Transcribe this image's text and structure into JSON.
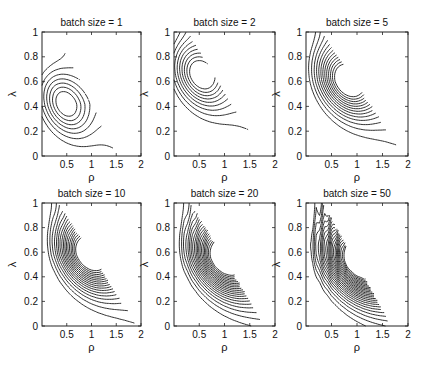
{
  "chart_data": [
    {
      "type": "contour",
      "title": "batch size = 1",
      "xlabel": "ρ",
      "ylabel": "λ",
      "xlim": [
        0,
        2
      ],
      "ylim": [
        0,
        1
      ],
      "xticks": [
        "0.5",
        "1",
        "1.5",
        "2"
      ],
      "yticks": [
        "0",
        "0.2",
        "0.4",
        "0.6",
        "0.8",
        "1"
      ],
      "batch_size": 1,
      "contour_levels": 7,
      "optimum": {
        "rho": 0.45,
        "lambda": 0.42
      },
      "zero_boundary_rho_at_lambda0": 1.55
    },
    {
      "type": "contour",
      "title": "batch size = 2",
      "xlabel": "ρ",
      "ylabel": "λ",
      "xlim": [
        0,
        2
      ],
      "ylim": [
        0,
        1
      ],
      "xticks": [
        "0.5",
        "1",
        "1.5",
        "2"
      ],
      "yticks": [
        "0",
        "0.2",
        "0.4",
        "0.6",
        "0.8",
        "1"
      ],
      "batch_size": 2,
      "contour_levels": 9,
      "optimum": {
        "rho": 0.5,
        "lambda": 0.65
      },
      "zero_boundary_rho_at_lambda0": 1.8
    },
    {
      "type": "contour",
      "title": "batch size = 5",
      "xlabel": "ρ",
      "ylabel": "λ",
      "xlim": [
        0,
        2
      ],
      "ylim": [
        0,
        1
      ],
      "xticks": [
        "0.5",
        "1",
        "1.5",
        "2"
      ],
      "yticks": [
        "0",
        "0.2",
        "0.4",
        "0.6",
        "0.8",
        "1"
      ],
      "batch_size": 5,
      "contour_levels": 13,
      "optimum": {
        "rho": 0.8,
        "lambda": 0.6
      },
      "zero_boundary_rho_at_lambda0": 1.95
    },
    {
      "type": "contour",
      "title": "batch size = 10",
      "xlabel": "ρ",
      "ylabel": "λ",
      "xlim": [
        0,
        2
      ],
      "ylim": [
        0,
        1
      ],
      "xticks": [
        "0.5",
        "1",
        "1.5",
        "2"
      ],
      "yticks": [
        "0",
        "0.2",
        "0.4",
        "0.6",
        "0.8",
        "1"
      ],
      "batch_size": 10,
      "contour_levels": 17,
      "optimum": {
        "rho": 0.95,
        "lambda": 0.58
      },
      "zero_boundary_rho_at_lambda0": 1.95
    },
    {
      "type": "contour",
      "title": "batch size = 20",
      "xlabel": "ρ",
      "ylabel": "λ",
      "xlim": [
        0,
        2
      ],
      "ylim": [
        0,
        1
      ],
      "xticks": [
        "0.5",
        "1",
        "1.5",
        "2"
      ],
      "yticks": [
        "0",
        "0.2",
        "0.4",
        "0.6",
        "0.8",
        "1"
      ],
      "batch_size": 20,
      "contour_levels": 20,
      "optimum": {
        "rho": 1.0,
        "lambda": 0.55
      },
      "zero_boundary_rho_at_lambda0": 1.82
    },
    {
      "type": "contour",
      "title": "batch size = 50",
      "xlabel": "ρ",
      "ylabel": "λ",
      "xlim": [
        0,
        2
      ],
      "ylim": [
        0,
        1
      ],
      "xticks": [
        "0.5",
        "1",
        "1.5",
        "2"
      ],
      "yticks": [
        "0",
        "0.2",
        "0.4",
        "0.6",
        "0.8",
        "1"
      ],
      "batch_size": 50,
      "contour_levels": 24,
      "optimum": {
        "rho": 1.05,
        "lambda": 0.53
      },
      "zero_boundary_rho_at_lambda0": 1.7
    }
  ]
}
